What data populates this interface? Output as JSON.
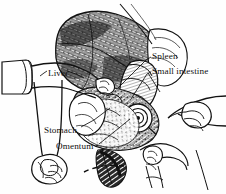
{
  "figure": {
    "type": "anatomical-line-drawing",
    "background_color": "#fefefe",
    "ink_color": "#111111",
    "width": 226,
    "height": 194
  },
  "labels": {
    "spleen": "Spleen",
    "small_intestine": "Small intestine",
    "liver": "Liver",
    "stomach": "Stomach",
    "omentum": "Omentum"
  },
  "callouts": [
    {
      "name": "spleen",
      "text": "Spleen",
      "label_x": 152,
      "label_y": 52,
      "leader_from": [
        150,
        57
      ],
      "leader_to": [
        118,
        88
      ]
    },
    {
      "name": "small-intestine",
      "text": "Small intestine",
      "label_x": 152,
      "label_y": 67,
      "leader_from": [
        150,
        72
      ],
      "leader_to": [
        131,
        99
      ]
    },
    {
      "name": "liver",
      "text": "Liver",
      "label_x": 48,
      "label_y": 69,
      "leader_from": [
        47,
        72
      ],
      "leader_to": [
        40,
        76
      ]
    },
    {
      "name": "stomach",
      "text": "Stomach",
      "label_x": 44,
      "label_y": 126,
      "leader_from": [
        80,
        126
      ],
      "leader_to": [
        110,
        108
      ]
    },
    {
      "name": "omentum",
      "text": "Omentum",
      "label_x": 56,
      "label_y": 142,
      "leader_from": [
        97,
        143
      ],
      "leader_to": [
        128,
        119
      ]
    }
  ],
  "anatomy_regions": [
    {
      "name": "liver-mass",
      "description": "Large dark mottled lobed organ occupying upper half"
    },
    {
      "name": "spleen-region",
      "description": "Elongate hatched organ right of midline"
    },
    {
      "name": "small-intestine",
      "description": "Coiled loops with spiral colon at right centre"
    },
    {
      "name": "stomach-region",
      "description": "Rounded viscus left of midline, lower half"
    },
    {
      "name": "omentum-region",
      "description": "Fatty veil draped over intestines, centre-bottom"
    }
  ],
  "hands": [
    {
      "name": "upper-left-arm-hand",
      "description": "Sleeved forearm entering from left, fingers gripping body wall at centre"
    },
    {
      "name": "lower-left-hand",
      "description": "Hand gripping flap of tissue at bottom left"
    },
    {
      "name": "right-hand",
      "description": "Hand with fingers pointing left from right edge"
    },
    {
      "name": "bottom-right-hand",
      "description": "Small hand holding instrument at lower right"
    }
  ]
}
